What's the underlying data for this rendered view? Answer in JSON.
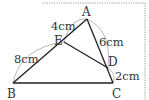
{
  "figure": {
    "width": 149,
    "height": 100,
    "colors": {
      "line": "#222222",
      "arc": "#888888",
      "frame": "#999999",
      "text": "#333333"
    },
    "points": {
      "A": {
        "label": "A",
        "x": 87,
        "y": 19
      },
      "B": {
        "label": "B",
        "x": 13,
        "y": 83
      },
      "C": {
        "label": "C",
        "x": 113,
        "y": 83
      },
      "D": {
        "label": "D",
        "x": 108,
        "y": 68
      },
      "E": {
        "label": "E",
        "x": 64,
        "y": 42
      }
    },
    "segments": [
      {
        "from": "A",
        "to": "B"
      },
      {
        "from": "A",
        "to": "C"
      },
      {
        "from": "B",
        "to": "C"
      },
      {
        "from": "E",
        "to": "D"
      }
    ],
    "measurements": {
      "AE": "4cm",
      "AD": "6cm",
      "EB": "8cm",
      "DC": "2cm"
    }
  }
}
